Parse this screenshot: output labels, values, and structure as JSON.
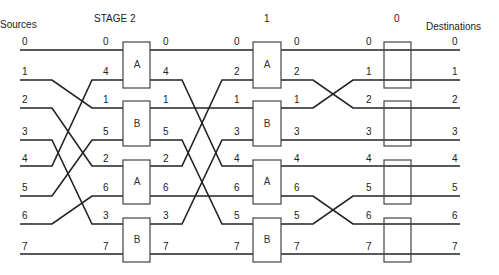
{
  "headers": {
    "sources": "Sources",
    "stage2": "STAGE 2",
    "stage1": "1",
    "stage0": "0",
    "destinations": "Destinations"
  },
  "sources": [
    "0",
    "1",
    "2",
    "3",
    "4",
    "5",
    "6",
    "7"
  ],
  "stage2_inputs": [
    "0",
    "4",
    "1",
    "5",
    "2",
    "6",
    "3",
    "7"
  ],
  "stage2_outputs": [
    "0",
    "4",
    "1",
    "5",
    "2",
    "6",
    "3",
    "7"
  ],
  "stage1_inputs": [
    "0",
    "2",
    "1",
    "3",
    "4",
    "6",
    "5",
    "7"
  ],
  "stage1_outputs": [
    "0",
    "2",
    "1",
    "3",
    "4",
    "6",
    "5",
    "7"
  ],
  "stage0_inputs": [
    "0",
    "1",
    "2",
    "3",
    "4",
    "5",
    "6",
    "7"
  ],
  "destinations": [
    "0",
    "1",
    "2",
    "3",
    "4",
    "5",
    "6",
    "7"
  ],
  "stage2_boxes": [
    "A",
    "B",
    "A",
    "B"
  ],
  "stage1_boxes": [
    "A",
    "B",
    "A",
    "B"
  ],
  "stage0_boxes": [
    "",
    "",
    "",
    ""
  ],
  "colors": {
    "line": "#222222",
    "box": "#444444"
  }
}
